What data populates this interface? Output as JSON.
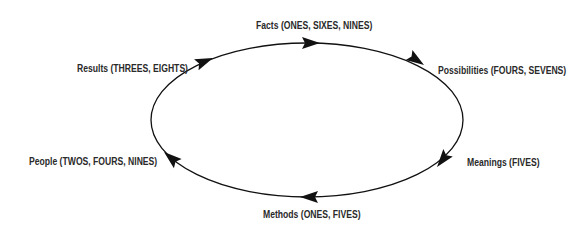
{
  "diagram": {
    "type": "cycle",
    "direction": "clockwise",
    "line_color": "#111111",
    "nodes": [
      {
        "id": "facts",
        "label": "Facts (ONES, SIXES, NINES)"
      },
      {
        "id": "possibilities",
        "label": "Possibilities (FOURS, SEVENS)"
      },
      {
        "id": "meanings",
        "label": "Meanings (FIVES)"
      },
      {
        "id": "methods",
        "label": "Methods (ONES, FIVES)"
      },
      {
        "id": "people",
        "label": "People (TWOS, FOURS, NINES)"
      },
      {
        "id": "results",
        "label": "Results (THREES, EIGHTS)"
      }
    ]
  }
}
